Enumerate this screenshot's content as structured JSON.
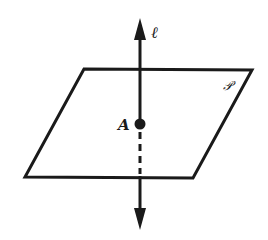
{
  "diagram": {
    "type": "line perpendicular to plane",
    "colors": {
      "stroke": "#1a1a1a",
      "background": "#ffffff"
    },
    "plane": {
      "label": "𝒫",
      "vertices": [
        [
          84,
          69
        ],
        [
          252,
          70
        ],
        [
          193,
          178
        ],
        [
          25,
          177
        ]
      ]
    },
    "line": {
      "label": "ℓ",
      "x": 140,
      "top_tip_y": 18,
      "bottom_tip_y": 230,
      "hidden_segment": [
        128,
        176
      ]
    },
    "point": {
      "label": "A",
      "x": 140,
      "y": 124
    }
  }
}
